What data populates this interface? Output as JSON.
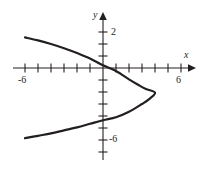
{
  "figure": {
    "kind": "math-graph",
    "width": 201,
    "height": 169,
    "background_color": "#ffffff",
    "ink_color": "#231f20"
  },
  "axes": {
    "x_axis_label": "x",
    "y_axis_label": "y",
    "x_tick_labels": [
      "-6",
      "6"
    ],
    "y_tick_labels": [
      "2",
      "-6"
    ],
    "x_label_left": "-6",
    "x_label_right": "6",
    "y_label_top": "2",
    "y_label_bottom": "-6",
    "x_range": [
      -6.8,
      6.8
    ],
    "y_range": [
      -7.6,
      4.4
    ],
    "x_tick_step": 1,
    "y_tick_step": 1,
    "grid": false,
    "arrowheads": [
      "x-positive",
      "y-positive"
    ]
  },
  "chart_data": {
    "type": "line",
    "title": "",
    "xlabel": "x",
    "ylabel": "y",
    "xlim": [
      -6.8,
      6.8
    ],
    "ylim": [
      -7.6,
      4.4
    ],
    "grid": false,
    "legend": "none",
    "curve_description": "leftward-opening parabola",
    "vertex": [
      4.0,
      -2.0
    ],
    "x_intercepts": [
      2.7
    ],
    "y_intercepts": [
      0.2,
      -4.3
    ],
    "series": [
      {
        "name": "parabola",
        "points": [
          [
            -6.0,
            2.55
          ],
          [
            -5.0,
            2.3
          ],
          [
            -4.0,
            2.0
          ],
          [
            -3.0,
            1.65
          ],
          [
            -2.0,
            1.25
          ],
          [
            -1.0,
            0.8
          ],
          [
            0.0,
            0.22
          ],
          [
            1.0,
            -0.25
          ],
          [
            2.0,
            -0.95
          ],
          [
            2.7,
            -1.4
          ],
          [
            3.3,
            -1.75
          ],
          [
            4.0,
            -2.05
          ],
          [
            3.6,
            -2.55
          ],
          [
            3.0,
            -3.0
          ],
          [
            2.0,
            -3.65
          ],
          [
            1.0,
            -4.1
          ],
          [
            0.0,
            -4.35
          ],
          [
            -1.0,
            -4.65
          ],
          [
            -2.0,
            -4.95
          ],
          [
            -3.0,
            -5.2
          ],
          [
            -4.0,
            -5.45
          ],
          [
            -5.0,
            -5.65
          ],
          [
            -6.0,
            -5.85
          ]
        ]
      }
    ]
  }
}
